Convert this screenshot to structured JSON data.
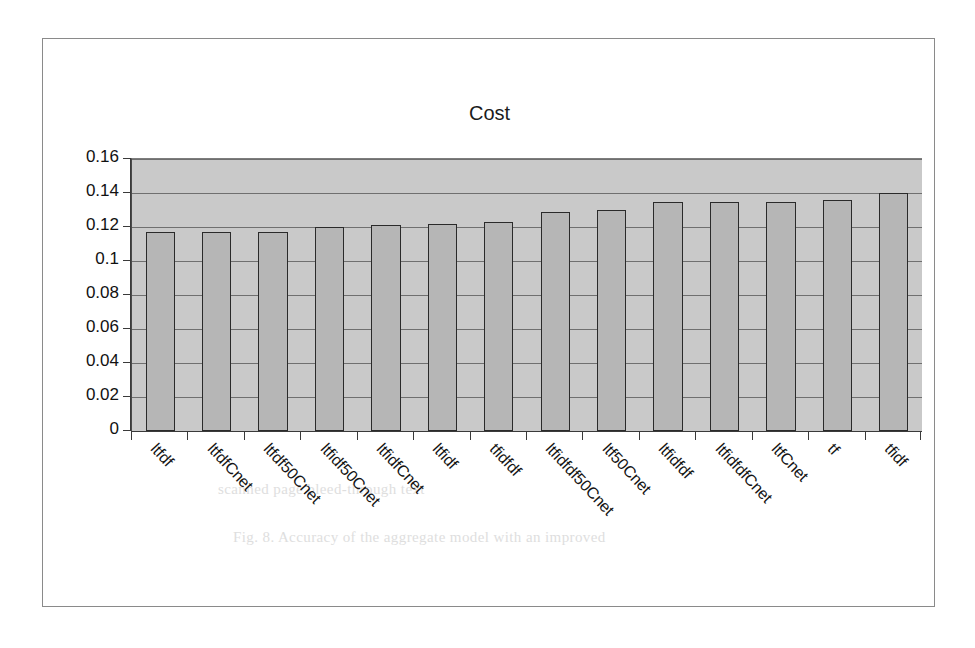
{
  "chart_data": {
    "type": "bar",
    "title": "Cost",
    "xlabel": "",
    "ylabel": "",
    "ylim": [
      0,
      0.16
    ],
    "yticks": [
      "0",
      "0.02",
      "0.04",
      "0.06",
      "0.08",
      "0.1",
      "0.12",
      "0.14",
      "0.16"
    ],
    "ytick_values": [
      0,
      0.02,
      0.04,
      0.06,
      0.08,
      0.1,
      0.12,
      0.14,
      0.16
    ],
    "grid": true,
    "legend": null,
    "plot_background": "#c9c9c9",
    "bar_fill": "#b6b6b6",
    "bar_outline": "#2a2a2a",
    "categories": [
      "ltfdf",
      "ltfdfCnet",
      "ltfdf50Cnet",
      "ltfidf50Cnet",
      "ltfidfCnet",
      "ltfidf",
      "tfidfdf",
      "ltfidfdf50Cnet",
      "ltf50Cnet",
      "ltfidfdf",
      "ltfidfdfCnet",
      "ltfCnet",
      "tf",
      "tfidf"
    ],
    "values": [
      0.117,
      0.117,
      0.117,
      0.12,
      0.121,
      0.122,
      0.123,
      0.129,
      0.13,
      0.135,
      0.135,
      0.135,
      0.136,
      0.14
    ]
  },
  "ghost": {
    "line1": "scanned page bleed-through text",
    "line2": "Fig. 8. Accuracy of the aggregate model with an improved"
  }
}
